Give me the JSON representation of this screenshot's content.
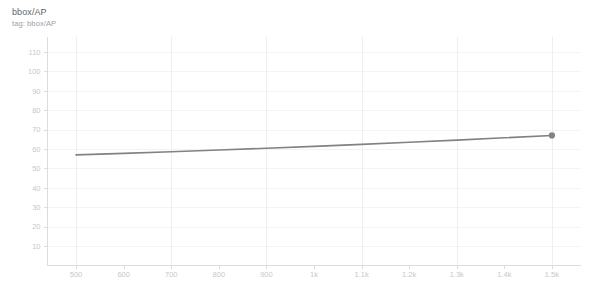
{
  "chart_title": "bbox/AP",
  "chart_subtitle": "tag: bbox/AP",
  "colors": {
    "series_line": "#7f8385",
    "marker": "#7f8385",
    "gridline": "#f1f3f4",
    "axis": "#dadce0",
    "tick_label": "#c6c9cc",
    "title_text": "#5f6368",
    "subtitle_text": "#9aa0a6",
    "background": "#ffffff"
  },
  "chart_data": {
    "type": "line",
    "title": "bbox/AP",
    "subtitle": "tag: bbox/AP",
    "xlabel": "",
    "ylabel": "",
    "xlim": [
      440,
      1560
    ],
    "ylim": [
      0,
      118
    ],
    "grid": true,
    "legend": "none",
    "ytick_values": [
      10,
      20,
      30,
      40,
      50,
      60,
      70,
      80,
      90,
      100,
      110
    ],
    "ytick_labels": [
      "10",
      "20",
      "30",
      "40",
      "50",
      "60",
      "70",
      "80",
      "90",
      "100",
      "110"
    ],
    "xtick_values": [
      500,
      600,
      700,
      800,
      900,
      1000,
      1100,
      1200,
      1300,
      1400,
      1500
    ],
    "xtick_labels": [
      "500",
      "600",
      "700",
      "800",
      "900",
      "1k",
      "1.1k",
      "1.2k",
      "1.3k",
      "1.4k",
      "1.5k"
    ],
    "series": [
      {
        "name": "bbox/AP",
        "color": "#7f8385",
        "x": [
          500,
          600,
          700,
          800,
          900,
          1000,
          1100,
          1200,
          1300,
          1400,
          1500
        ],
        "values": [
          57.0,
          57.8,
          58.6,
          59.5,
          60.4,
          61.4,
          62.4,
          63.5,
          64.6,
          65.8,
          67.0
        ],
        "marker_at_last_point": true
      }
    ]
  }
}
